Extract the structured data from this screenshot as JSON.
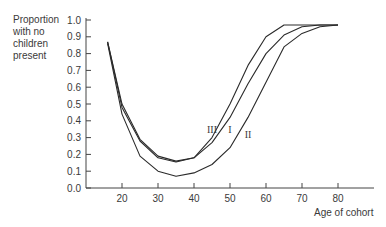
{
  "chart_data": {
    "type": "line",
    "title": "",
    "xlabel": "Age of cohort",
    "ylabel": "Proportion with no children present",
    "xlim": [
      10,
      90
    ],
    "ylim": [
      0.0,
      1.0
    ],
    "grid": false,
    "legend": "inline labels on curves",
    "x_ticks": [
      20,
      30,
      40,
      50,
      60,
      70,
      80
    ],
    "y_ticks": [
      "0.0",
      "0.1",
      "0.2",
      "0.3",
      "0.4",
      "0.5",
      "0.6",
      "0.7",
      "0.8",
      "0.9",
      "1.0"
    ],
    "x": [
      16,
      20,
      25,
      30,
      35,
      40,
      45,
      50,
      55,
      60,
      65,
      70,
      75,
      80
    ],
    "series": [
      {
        "name": "III",
        "values": [
          0.87,
          0.5,
          0.29,
          0.19,
          0.16,
          0.18,
          0.3,
          0.5,
          0.73,
          0.9,
          0.97,
          0.97,
          0.97,
          0.97
        ]
      },
      {
        "name": "I",
        "values": [
          0.87,
          0.48,
          0.28,
          0.18,
          0.155,
          0.18,
          0.27,
          0.42,
          0.62,
          0.8,
          0.91,
          0.96,
          0.97,
          0.97
        ]
      },
      {
        "name": "II",
        "values": [
          0.86,
          0.44,
          0.19,
          0.1,
          0.07,
          0.09,
          0.14,
          0.24,
          0.42,
          0.63,
          0.84,
          0.92,
          0.96,
          0.97
        ]
      }
    ],
    "annotations": [
      {
        "text": "III",
        "x": 45,
        "y": 0.33
      },
      {
        "text": "I",
        "x": 50,
        "y": 0.33
      },
      {
        "text": "II",
        "x": 55,
        "y": 0.3
      }
    ]
  },
  "labels": {
    "ylabel": "Proportion\nwith no\nchildren\npresent",
    "xlabel": "Age of cohort"
  }
}
